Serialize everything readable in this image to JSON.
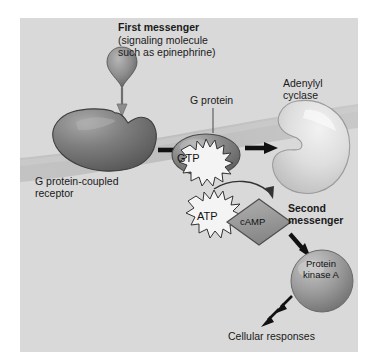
{
  "figure": {
    "background_color": "#ffffff",
    "panel_color": "#d9d9d9",
    "membrane_color": "#bfbfbf"
  },
  "labels": {
    "first_messenger": "First messenger",
    "first_messenger_sub_line1": "(signaling molecule",
    "first_messenger_sub_line2": "such as epinephrine)",
    "gpcr_line1": "G protein-coupled",
    "gpcr_line2": "receptor",
    "g_protein": "G protein",
    "adenylyl_line1": "Adenylyl",
    "adenylyl_line2": "cyclase",
    "second_messenger_line1": "Second",
    "second_messenger_line2": "messenger",
    "cellular_responses": "Cellular responses"
  },
  "molecules": {
    "gtp": "GTP",
    "atp": "ATP",
    "camp": "cAMP",
    "pka_line1": "Protein",
    "pka_line2": "kinase A"
  },
  "shapes": {
    "ligand_color": "#8a8a8a",
    "receptor_color": "#787878",
    "g_protein_color": "#8d8d8d",
    "adenylyl_cyclase_color": "#dcdcdc",
    "camp_diamond_color": "#9a9a9a",
    "pka_sphere_color": "#9d9d9d",
    "starburst_fill": "#f2f2f2",
    "arrow_color": "#111111"
  }
}
